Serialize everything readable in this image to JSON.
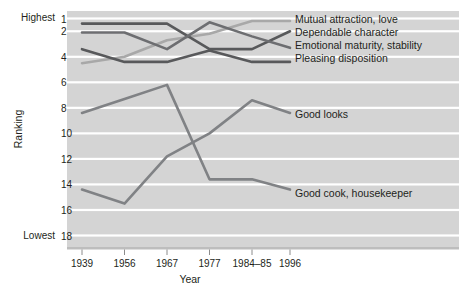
{
  "chart_data": {
    "type": "line",
    "title": "",
    "xlabel": "Year",
    "ylabel": "Ranking",
    "categories": [
      "1939",
      "1956",
      "1967",
      "1977",
      "1984–85",
      "1996"
    ],
    "x_tick_labels": [
      "1939",
      "1956",
      "1967",
      "1977",
      "1984–85",
      "1996"
    ],
    "y_tick_labels": [
      "1",
      "2",
      "4",
      "6",
      "8",
      "10",
      "12",
      "14",
      "16",
      "18"
    ],
    "y_tick_values": [
      1,
      2,
      4,
      6,
      8,
      10,
      12,
      14,
      16,
      18
    ],
    "ylim": [
      1,
      18
    ],
    "y_axis_inverted": true,
    "y_extreme_high_label": "Highest",
    "y_extreme_low_label": "Lowest",
    "grid": true,
    "grid_orientation": "horizontal",
    "legend_position": "inline-right",
    "plot_background": "#d4d4d4",
    "gridline_color": "#ffffff",
    "series": [
      {
        "name": "Mutual attraction, love",
        "label": "Mutual attraction, love",
        "color": "#a8a8a8",
        "values": [
          4.5,
          4.0,
          2.7,
          2.2,
          1.2,
          1.2
        ]
      },
      {
        "name": "Dependable character",
        "label": "Dependable character",
        "color": "#58595b",
        "values": [
          1.4,
          1.4,
          1.4,
          3.4,
          3.4,
          2.0
        ]
      },
      {
        "name": "Emotional maturity, stability",
        "label": "Emotional maturity, stability",
        "color": "#6d6e71",
        "values": [
          2.1,
          2.1,
          3.4,
          1.3,
          2.4,
          3.3
        ]
      },
      {
        "name": "Pleasing disposition",
        "label": "Pleasing disposition",
        "color": "#58595b",
        "values": [
          3.4,
          4.4,
          4.4,
          3.5,
          4.4,
          4.4
        ]
      },
      {
        "name": "Good looks",
        "label": "Good looks",
        "color": "#808285",
        "values": [
          8.4,
          7.3,
          6.2,
          13.6,
          13.6,
          14.4
        ]
      },
      {
        "name": "Good cook, housekeeper",
        "label": "Good cook, housekeeper",
        "color": "#808285",
        "values": [
          14.4,
          15.5,
          11.8,
          10.0,
          7.4,
          8.4
        ]
      }
    ]
  },
  "axis": {
    "y_title": "Ranking",
    "x_title": "Year",
    "highest": "Highest",
    "lowest": "Lowest"
  },
  "y_ticks": [
    {
      "label": "1",
      "value": 1
    },
    {
      "label": "2",
      "value": 2
    },
    {
      "label": "4",
      "value": 4
    },
    {
      "label": "6",
      "value": 6
    },
    {
      "label": "8",
      "value": 8
    },
    {
      "label": "10",
      "value": 10
    },
    {
      "label": "12",
      "value": 12
    },
    {
      "label": "14",
      "value": 14
    },
    {
      "label": "16",
      "value": 16
    },
    {
      "label": "18",
      "value": 18
    }
  ],
  "x_ticks": [
    {
      "label": "1939"
    },
    {
      "label": "1956"
    },
    {
      "label": "1967"
    },
    {
      "label": "1977"
    },
    {
      "label": "1984–85"
    },
    {
      "label": "1996"
    }
  ],
  "series_labels": [
    {
      "label": "Mutual attraction, love"
    },
    {
      "label": "Dependable character"
    },
    {
      "label": "Emotional maturity, stability"
    },
    {
      "label": "Pleasing disposition"
    },
    {
      "label": "Good looks"
    },
    {
      "label": "Good cook, housekeeper"
    }
  ]
}
